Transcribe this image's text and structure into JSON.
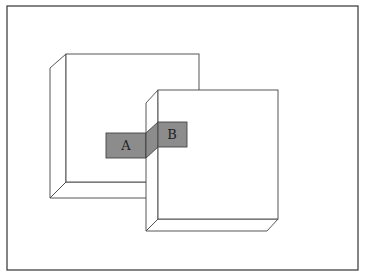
{
  "diagram": {
    "labels": {
      "a": "A",
      "b": "B"
    },
    "colors": {
      "stroke": "#333333",
      "frame": "#333333",
      "panel_fill": "#ffffff",
      "connector_fill": "#8c8c8c",
      "background": "#ffffff"
    },
    "panels": [
      {
        "name": "left-panel",
        "back": {
          "x1": 66,
          "y1": 54,
          "x2": 199,
          "y2": 182
        },
        "front_left_x": 50,
        "front_top_y": 68,
        "front_bottom_y": 198
      },
      {
        "name": "right-panel",
        "back": {
          "x1": 158,
          "y1": 90,
          "x2": 278,
          "y2": 219
        },
        "front_left_x": 146,
        "front_top_y": 103,
        "front_bottom_y": 231
      }
    ]
  }
}
